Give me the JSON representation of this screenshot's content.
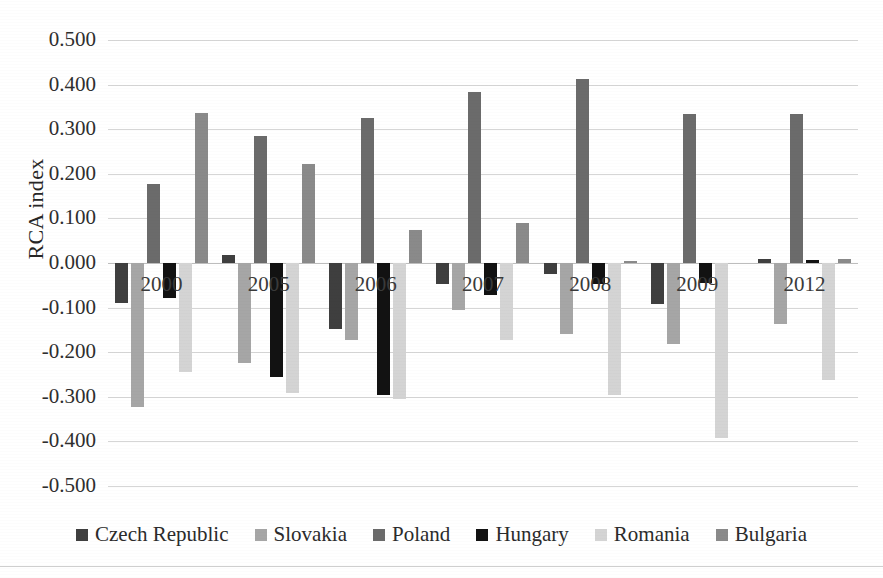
{
  "chart_data": {
    "type": "bar",
    "title": "",
    "subtitle": "",
    "xlabel": "",
    "ylabel": "RCA index",
    "categories": [
      "2000",
      "2005",
      "2006",
      "2007",
      "2008",
      "2009",
      "2012"
    ],
    "ylim": [
      -0.5,
      0.5
    ],
    "ytick_values": [
      0.5,
      0.4,
      0.3,
      0.2,
      0.1,
      0.0,
      -0.1,
      -0.2,
      -0.3,
      -0.4,
      -0.5
    ],
    "ytick_labels": [
      "0.500",
      "0.400",
      "0.300",
      "0.200",
      "0.100",
      "0.000",
      "-0.100",
      "-0.200",
      "-0.300",
      "-0.400",
      "-0.500"
    ],
    "grid": true,
    "legend_position": "bottom",
    "series": [
      {
        "name": "Czech Republic",
        "color": "#3f3f3f",
        "values": [
          -0.09,
          0.019,
          -0.147,
          -0.048,
          -0.025,
          -0.092,
          0.01
        ]
      },
      {
        "name": "Slovakia",
        "color": "#a6a6a6",
        "values": [
          -0.322,
          -0.225,
          -0.172,
          -0.105,
          -0.16,
          -0.182,
          -0.136
        ]
      },
      {
        "name": "Poland",
        "color": "#6b6b6b",
        "values": [
          0.177,
          0.285,
          0.325,
          0.384,
          0.412,
          0.335,
          0.335
        ]
      },
      {
        "name": "Hungary",
        "color": "#121212",
        "values": [
          -0.078,
          -0.256,
          -0.297,
          -0.072,
          -0.048,
          -0.045,
          0.007
        ]
      },
      {
        "name": "Romania",
        "color": "#d4d4d4",
        "values": [
          -0.245,
          -0.292,
          -0.305,
          -0.173,
          -0.297,
          -0.392,
          -0.262
        ]
      },
      {
        "name": "Bulgaria",
        "color": "#8a8a8a",
        "values": [
          0.337,
          0.222,
          0.073,
          0.09,
          0.004,
          0.0,
          0.008
        ]
      }
    ]
  }
}
